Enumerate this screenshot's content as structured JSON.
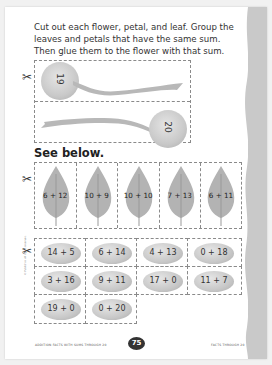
{
  "instructions": "Cut out each flower, petal, and leaf. Group the leaves and petals that have the same sum. Then glue them to the flower with that sum.",
  "flowers": [
    {
      "number": "19",
      "orientation": "rotated-left"
    },
    {
      "number": "20",
      "orientation": "rotated-right"
    }
  ],
  "heading": "See below.",
  "leaves": [
    {
      "label": "6 + 12"
    },
    {
      "label": "10 + 9"
    },
    {
      "label": "10 + 10"
    },
    {
      "label": "7 + 13"
    },
    {
      "label": "6 + 11"
    }
  ],
  "petals": [
    [
      {
        "label": "14 + 5"
      },
      {
        "label": "6 + 14"
      },
      {
        "label": "4 + 13"
      },
      {
        "label": "0 + 18"
      }
    ],
    [
      {
        "label": "3 + 16"
      },
      {
        "label": "9 + 11"
      },
      {
        "label": "17 + 0"
      },
      {
        "label": "11 + 7"
      }
    ],
    [
      {
        "label": "19 + 0"
      },
      {
        "label": "0 + 20"
      }
    ]
  ],
  "icons": {
    "cut": "scissors-icon"
  },
  "footer": {
    "left": "ADDITION FACTS WITH SUMS THROUGH 20",
    "page_number": "75",
    "right": "FACTS THROUGH 20"
  },
  "colors": {
    "page": "#ffffff",
    "background": "#f1f1f1",
    "torn_edge": "#c9c9c9",
    "art_gray": "#bdbdbd",
    "text": "#333333"
  }
}
